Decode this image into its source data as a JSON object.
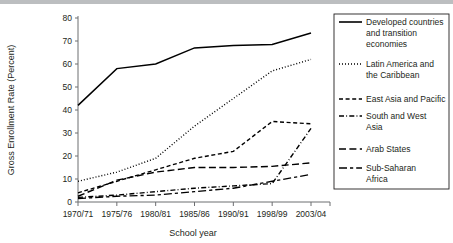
{
  "chart_data": {
    "type": "line",
    "title": "",
    "xlabel": "School year",
    "ylabel": "Gross Enrollment Rate (Percent)",
    "categories": [
      "1970/71",
      "1975/76",
      "1980/81",
      "1985/86",
      "1990/91",
      "1998/99",
      "2003/04"
    ],
    "ylim": [
      0,
      80
    ],
    "yticks": [
      0,
      10,
      20,
      30,
      40,
      50,
      60,
      70,
      80
    ],
    "grid": false,
    "legend_position": "right",
    "series": [
      {
        "name": "Developed countries and transition economies",
        "style": "solid",
        "values": [
          42,
          58,
          60,
          67,
          68,
          68.5,
          73.5
        ]
      },
      {
        "name": "Latin America and the Caribbean",
        "style": "dotted",
        "values": [
          9,
          13,
          19,
          33,
          45,
          57,
          62
        ]
      },
      {
        "name": "East Asia and Pacific",
        "style": "dashed",
        "values": [
          4,
          9,
          14,
          19,
          22,
          35,
          34
        ]
      },
      {
        "name": "South and West Asia",
        "style": "dash-dot",
        "values": [
          2,
          3,
          4.5,
          6,
          7,
          8,
          32
        ]
      },
      {
        "name": "Arab States",
        "style": "long-dash",
        "values": [
          2.5,
          9.5,
          13,
          15,
          15,
          15.5,
          17
        ]
      },
      {
        "name": "Sub-Saharan Africa",
        "style": "long-dash-short-dash",
        "values": [
          1.5,
          2.5,
          3,
          4.5,
          6,
          9,
          12
        ]
      }
    ]
  },
  "legend": {
    "items": [
      {
        "label_lines": [
          "Developed countries",
          "and transition",
          "economies"
        ],
        "style": "solid"
      },
      {
        "label_lines": [
          "Latin America and",
          "the Caribbean"
        ],
        "style": "dotted"
      },
      {
        "label_lines": [
          "East Asia and Pacific"
        ],
        "style": "dashed"
      },
      {
        "label_lines": [
          "South and West",
          "Asia"
        ],
        "style": "dash-dot"
      },
      {
        "label_lines": [
          "Arab States"
        ],
        "style": "long-dash"
      },
      {
        "label_lines": [
          "Sub-Saharan",
          "Africa"
        ],
        "style": "long-dash-short-dash"
      }
    ]
  },
  "colors": {
    "line": "#000000",
    "axis": "#6d6e71",
    "text": "#231f20",
    "topbar": "#bcbec0"
  }
}
